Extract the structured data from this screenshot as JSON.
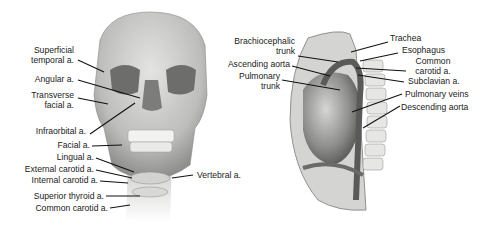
{
  "figures": [
    {
      "id": "head-neck",
      "description": "Anterior view of skull and neck showing arteries",
      "labels": [
        {
          "line1": "Superficial",
          "line2": "temporal a."
        },
        {
          "line1": "Angular a."
        },
        {
          "line1": "Transverse",
          "line2": "facial a."
        },
        {
          "line1": "Infraorbital a."
        },
        {
          "line1": "Facial a."
        },
        {
          "line1": "Lingual a."
        },
        {
          "line1": "External carotid a."
        },
        {
          "line1": "Internal carotid a."
        },
        {
          "line1": "Superior thyroid a."
        },
        {
          "line1": "Common carotid a."
        },
        {
          "line1": "Vertebral a."
        }
      ]
    },
    {
      "id": "thorax",
      "description": "Lateral view of thorax showing heart and great vessels",
      "labels": [
        {
          "line1": "Brachiocephalic",
          "line2": "trunk"
        },
        {
          "line1": "Ascending aorta"
        },
        {
          "line1": "Pulmonary",
          "line2": "trunk"
        },
        {
          "line1": "Trachea"
        },
        {
          "line1": "Esophagus"
        },
        {
          "line1": "Common",
          "line2": "carotid a."
        },
        {
          "line1": "Subclavian a."
        },
        {
          "line1": "Pulmonary veins"
        },
        {
          "line1": "Descending aorta"
        }
      ]
    }
  ]
}
